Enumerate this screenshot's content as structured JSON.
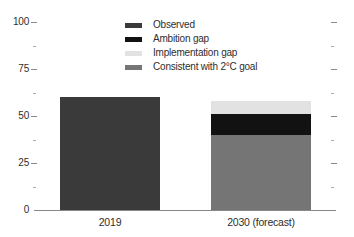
{
  "colors": {
    "observed": "#3a3a3a",
    "ambition_gap": "#121212",
    "implementation_gap": "#e2e2e2",
    "consistent_2c": "#757575",
    "axis_line": "#888888",
    "major_tick": "#8a8a8a",
    "minor_tick": "#aaaaaa",
    "text": "#2e2e2e"
  },
  "chart_data": {
    "type": "bar",
    "stacked": true,
    "title": "",
    "xlabel": "",
    "ylabel": "",
    "grid": false,
    "categories": [
      "2019",
      "2030 (forecast)"
    ],
    "series": [
      {
        "name": "Observed",
        "color_key": "observed",
        "values": [
          60,
          0
        ]
      },
      {
        "name": "Ambition gap",
        "color_key": "ambition_gap",
        "values": [
          0,
          11
        ]
      },
      {
        "name": "Implementation gap",
        "color_key": "implementation_gap",
        "values": [
          0,
          7
        ]
      },
      {
        "name": "Consistent with 2°C goal",
        "color_key": "consistent_2c",
        "values": [
          0,
          40
        ]
      }
    ],
    "stack_order_bottom_to_top": [
      "Observed",
      "Consistent with 2°C goal",
      "Ambition gap",
      "Implementation gap"
    ],
    "totals": {
      "2019": 60,
      "2030 (forecast)": 58
    },
    "y_axis": {
      "ticks": [
        0,
        25,
        50,
        75,
        100
      ],
      "tick_labels": [
        "0",
        "25",
        "50",
        "75",
        "100"
      ],
      "minor_ticks": [
        12.5,
        37.5,
        62.5,
        87.5
      ],
      "range": [
        0,
        100
      ],
      "ticks_on_right_side": true
    },
    "legend": {
      "position": "top-center",
      "entries": [
        "Observed",
        "Ambition gap",
        "Implementation gap",
        "Consistent with 2°C goal"
      ]
    }
  }
}
